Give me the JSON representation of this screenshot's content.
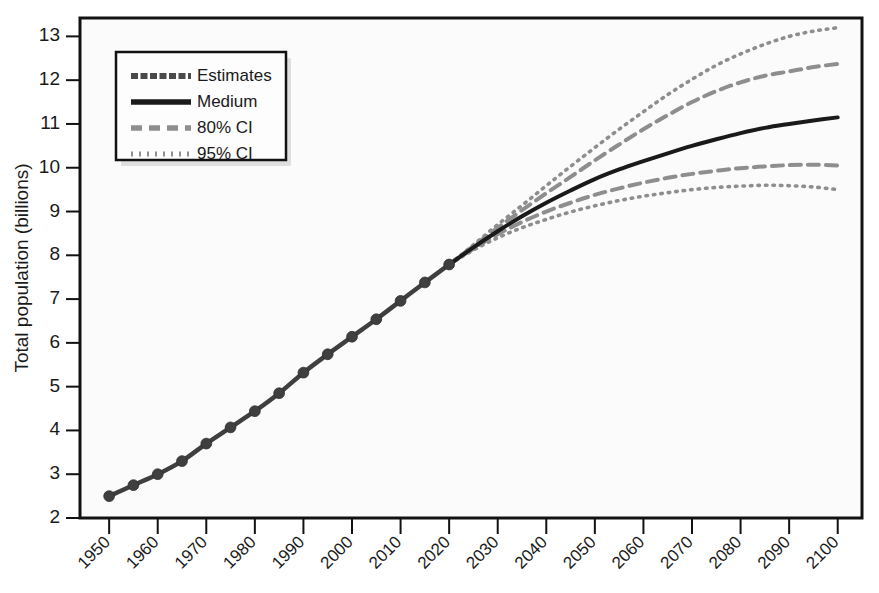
{
  "figure": {
    "title": "",
    "background_color": "#fbfbfb",
    "frame_color": "#121212"
  },
  "axes": {
    "ylabel": "Total population (billions)",
    "xlabel": "",
    "y_ticks": [
      "2",
      "3",
      "4",
      "5",
      "6",
      "7",
      "8",
      "9",
      "10",
      "11",
      "12",
      "13"
    ],
    "x_ticks": [
      "1950",
      "1960",
      "1970",
      "1980",
      "1990",
      "2000",
      "2010",
      "2020",
      "2030",
      "2040",
      "2050",
      "2060",
      "2070",
      "2080",
      "2090",
      "2100"
    ]
  },
  "legend": {
    "position": "top-left",
    "items": [
      {
        "label": "Estimates",
        "style": "thick-dotted-dark",
        "color": "#4a4a4a"
      },
      {
        "label": "Medium",
        "style": "solid",
        "color": "#1a1a1a"
      },
      {
        "label": "80% CI",
        "style": "dashed",
        "color": "#8c8c8c"
      },
      {
        "label": "95% CI",
        "style": "dotted",
        "color": "#8c8c8c"
      }
    ]
  },
  "chart_data": {
    "type": "line",
    "title": "",
    "xlabel": "",
    "ylabel": "Total population (billions)",
    "xlim": [
      1950,
      2100
    ],
    "ylim": [
      2,
      13.4
    ],
    "grid": false,
    "legend_position": "top-left",
    "x": [
      1950,
      1955,
      1960,
      1965,
      1970,
      1975,
      1980,
      1985,
      1990,
      1995,
      2000,
      2005,
      2010,
      2015,
      2020,
      2025,
      2030,
      2035,
      2040,
      2045,
      2050,
      2055,
      2060,
      2065,
      2070,
      2075,
      2080,
      2085,
      2090,
      2095,
      2100
    ],
    "series": [
      {
        "name": "Estimates",
        "marker": "circle",
        "x": [
          1950,
          1955,
          1960,
          1965,
          1970,
          1975,
          1980,
          1985,
          1990,
          1995,
          2000,
          2005,
          2010,
          2015,
          2020
        ],
        "values": [
          2.5,
          2.75,
          3.0,
          3.3,
          3.7,
          4.07,
          4.44,
          4.85,
          5.32,
          5.74,
          6.14,
          6.54,
          6.96,
          7.38,
          7.79
        ]
      },
      {
        "name": "Medium",
        "x": [
          2020,
          2025,
          2030,
          2035,
          2040,
          2045,
          2050,
          2055,
          2060,
          2065,
          2070,
          2075,
          2080,
          2085,
          2090,
          2095,
          2100
        ],
        "values": [
          7.79,
          8.18,
          8.55,
          8.89,
          9.2,
          9.48,
          9.74,
          9.96,
          10.15,
          10.33,
          10.5,
          10.65,
          10.79,
          10.91,
          11.0,
          11.08,
          11.15
        ]
      },
      {
        "name": "80% CI upper",
        "x": [
          2020,
          2025,
          2030,
          2035,
          2040,
          2045,
          2050,
          2055,
          2060,
          2065,
          2070,
          2075,
          2080,
          2085,
          2090,
          2095,
          2100
        ],
        "values": [
          7.79,
          8.21,
          8.63,
          9.03,
          9.42,
          9.79,
          10.17,
          10.53,
          10.88,
          11.2,
          11.5,
          11.75,
          11.95,
          12.1,
          12.2,
          12.3,
          12.37
        ]
      },
      {
        "name": "80% CI lower",
        "x": [
          2020,
          2025,
          2030,
          2035,
          2040,
          2045,
          2050,
          2055,
          2060,
          2065,
          2070,
          2075,
          2080,
          2085,
          2090,
          2095,
          2100
        ],
        "values": [
          7.79,
          8.15,
          8.48,
          8.76,
          9.0,
          9.2,
          9.38,
          9.53,
          9.66,
          9.77,
          9.86,
          9.93,
          9.99,
          10.03,
          10.06,
          10.07,
          10.05
        ]
      },
      {
        "name": "95% CI upper",
        "x": [
          2020,
          2025,
          2030,
          2035,
          2040,
          2045,
          2050,
          2055,
          2060,
          2065,
          2070,
          2075,
          2080,
          2085,
          2090,
          2095,
          2100
        ],
        "values": [
          7.79,
          8.24,
          8.7,
          9.14,
          9.59,
          10.03,
          10.46,
          10.88,
          11.28,
          11.67,
          12.02,
          12.34,
          12.6,
          12.82,
          13.0,
          13.12,
          13.2
        ]
      },
      {
        "name": "95% CI lower",
        "x": [
          2020,
          2025,
          2030,
          2035,
          2040,
          2045,
          2050,
          2055,
          2060,
          2065,
          2070,
          2075,
          2080,
          2085,
          2090,
          2095,
          2100
        ],
        "values": [
          7.79,
          8.12,
          8.4,
          8.63,
          8.82,
          8.99,
          9.13,
          9.25,
          9.35,
          9.43,
          9.5,
          9.55,
          9.58,
          9.6,
          9.59,
          9.56,
          9.5
        ]
      }
    ]
  },
  "plot_geometry": {
    "left": 80,
    "right": 862,
    "top": 18,
    "bottom": 518,
    "x_min": 1944,
    "x_max": 2105,
    "y_min": 2.0,
    "y_max": 13.42
  }
}
